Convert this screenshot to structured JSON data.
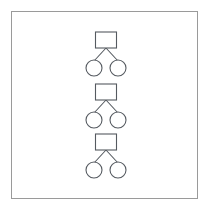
{
  "panel": {
    "background_color": "#ffffff",
    "border_color": "#9a9a9a",
    "x": 11,
    "y": 11,
    "width": 187,
    "height": 188
  },
  "diagram": {
    "type": "pedigree-tree",
    "stroke_color": "#555a60",
    "fill_color": "#ffffff",
    "center_x": 106,
    "square": {
      "width": 21,
      "height": 16
    },
    "circle": {
      "radius": 8
    },
    "child_offset_x": 12,
    "units": [
      {
        "name": "unit-1",
        "parent": {
          "shape": "square",
          "cx": 106,
          "cy": 40
        },
        "children": [
          {
            "shape": "circle",
            "cx": 94,
            "cy": 68
          },
          {
            "shape": "circle",
            "cx": 118,
            "cy": 68
          }
        ]
      },
      {
        "name": "unit-2",
        "parent": {
          "shape": "square",
          "cx": 106,
          "cy": 92
        },
        "children": [
          {
            "shape": "circle",
            "cx": 94,
            "cy": 120
          },
          {
            "shape": "circle",
            "cx": 118,
            "cy": 120
          }
        ]
      },
      {
        "name": "unit-3",
        "parent": {
          "shape": "square",
          "cx": 106,
          "cy": 142
        },
        "children": [
          {
            "shape": "circle",
            "cx": 94,
            "cy": 170
          },
          {
            "shape": "circle",
            "cx": 118,
            "cy": 170
          }
        ]
      }
    ]
  },
  "labels": {
    "parent_label": "",
    "child_label": ""
  }
}
